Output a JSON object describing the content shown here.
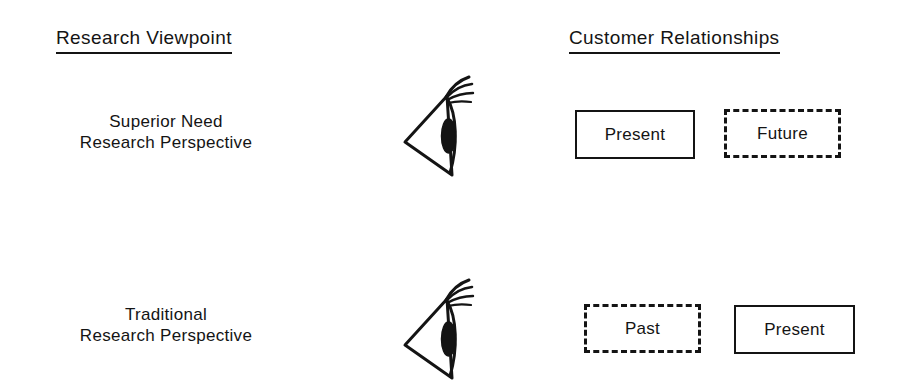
{
  "diagram": {
    "title_columns": [
      {
        "id": "research-viewpoint",
        "label": "Research Viewpoint"
      },
      {
        "id": "customer-relationships",
        "label": "Customer Relationships"
      }
    ],
    "rows": [
      {
        "id": "superior-need",
        "label_line1": "Superior Need",
        "label_line2": "Research Perspective",
        "icon": "eye-icon",
        "boxes": [
          {
            "id": "present-top",
            "label": "Present",
            "style": "solid"
          },
          {
            "id": "future",
            "label": "Future",
            "style": "dashed"
          }
        ]
      },
      {
        "id": "traditional",
        "label_line1": "Traditional",
        "label_line2": "Research Perspective",
        "icon": "eye-icon",
        "boxes": [
          {
            "id": "past",
            "label": "Past",
            "style": "dashed"
          },
          {
            "id": "present-bottom",
            "label": "Present",
            "style": "solid"
          }
        ]
      }
    ],
    "colors": {
      "ink": "#141414",
      "background": "#ffffff"
    }
  }
}
